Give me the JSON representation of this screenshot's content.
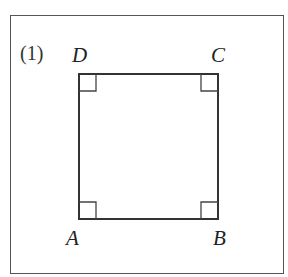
{
  "figure": {
    "problem_number": "(1)",
    "shape": "square",
    "vertices": [
      {
        "label": "A",
        "position": "bottom-left"
      },
      {
        "label": "B",
        "position": "bottom-right"
      },
      {
        "label": "C",
        "position": "top-right"
      },
      {
        "label": "D",
        "position": "top-left"
      }
    ],
    "right_angle_markers": [
      "A",
      "B",
      "C",
      "D"
    ],
    "colors": {
      "stroke": "#333333",
      "frame": "#555555",
      "background": "#ffffff"
    }
  }
}
